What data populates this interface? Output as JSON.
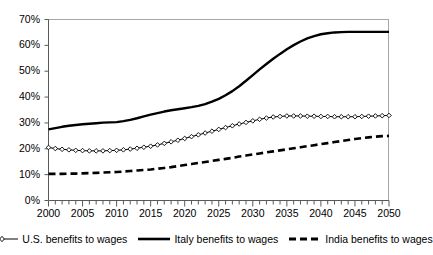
{
  "chart_data": {
    "type": "line",
    "title": "",
    "subtitle": "",
    "xlabel": "",
    "ylabel": "",
    "xlim": [
      2000,
      2050
    ],
    "ylim": [
      0,
      70
    ],
    "grid": false,
    "legend_position": "bottom",
    "y_tick_labels": [
      "70%",
      "60%",
      "50%",
      "40%",
      "30%",
      "20%",
      "10%",
      "0%"
    ],
    "y_ticks": [
      70,
      60,
      50,
      40,
      30,
      20,
      10,
      0
    ],
    "x_tick_labels": [
      "2000",
      "2005",
      "2010",
      "2015",
      "2020",
      "2025",
      "2030",
      "2035",
      "2040",
      "2045",
      "2050"
    ],
    "x_ticks": [
      2000,
      2005,
      2010,
      2015,
      2020,
      2025,
      2030,
      2035,
      2040,
      2045,
      2050
    ],
    "x_minor_tick_step": 1,
    "x": [
      2000,
      2001,
      2002,
      2003,
      2004,
      2005,
      2006,
      2007,
      2008,
      2009,
      2010,
      2011,
      2012,
      2013,
      2014,
      2015,
      2016,
      2017,
      2018,
      2019,
      2020,
      2021,
      2022,
      2023,
      2024,
      2025,
      2026,
      2027,
      2028,
      2029,
      2030,
      2031,
      2032,
      2033,
      2034,
      2035,
      2036,
      2037,
      2038,
      2039,
      2040,
      2041,
      2042,
      2043,
      2044,
      2045,
      2046,
      2047,
      2048,
      2049,
      2050
    ],
    "series": [
      {
        "name": "U.S. benefits to wages",
        "style": "solid-thin-markers",
        "marker": "diamond-open",
        "color": "#000000",
        "values": [
          20.5,
          20.1,
          19.8,
          19.6,
          19.4,
          19.3,
          19.2,
          19.2,
          19.2,
          19.3,
          19.4,
          19.6,
          19.9,
          20.2,
          20.6,
          21.0,
          21.5,
          22.1,
          22.7,
          23.3,
          24.0,
          24.7,
          25.4,
          26.1,
          26.8,
          27.5,
          28.2,
          28.9,
          29.6,
          30.2,
          30.8,
          31.4,
          31.9,
          32.3,
          32.5,
          32.7,
          32.7,
          32.7,
          32.6,
          32.6,
          32.5,
          32.5,
          32.4,
          32.4,
          32.4,
          32.4,
          32.5,
          32.6,
          32.7,
          32.8,
          32.9
        ]
      },
      {
        "name": "Italy benefits to wages",
        "style": "solid-thick",
        "marker": "none",
        "color": "#000000",
        "values": [
          27.5,
          28.0,
          28.5,
          28.9,
          29.2,
          29.5,
          29.7,
          29.9,
          30.1,
          30.2,
          30.3,
          30.7,
          31.2,
          31.8,
          32.5,
          33.2,
          33.8,
          34.4,
          34.9,
          35.3,
          35.7,
          36.1,
          36.6,
          37.3,
          38.2,
          39.3,
          40.7,
          42.3,
          44.2,
          46.3,
          48.5,
          50.7,
          52.8,
          54.8,
          56.7,
          58.5,
          60.1,
          61.5,
          62.7,
          63.6,
          64.3,
          64.7,
          65.0,
          65.1,
          65.2,
          65.2,
          65.2,
          65.2,
          65.2,
          65.2,
          65.2
        ]
      },
      {
        "name": "India benefits to wages",
        "style": "dashed-thick",
        "marker": "none",
        "color": "#000000",
        "values": [
          10.3,
          10.3,
          10.3,
          10.4,
          10.4,
          10.5,
          10.6,
          10.7,
          10.8,
          10.9,
          11.0,
          11.2,
          11.4,
          11.6,
          11.8,
          12.0,
          12.3,
          12.6,
          12.9,
          13.3,
          13.7,
          14.1,
          14.5,
          14.9,
          15.3,
          15.7,
          16.1,
          16.5,
          17.0,
          17.4,
          17.8,
          18.2,
          18.6,
          19.0,
          19.4,
          19.8,
          20.2,
          20.6,
          21.0,
          21.4,
          21.8,
          22.2,
          22.6,
          23.0,
          23.4,
          23.8,
          24.1,
          24.4,
          24.7,
          24.9,
          25.0
        ]
      }
    ],
    "legend": [
      {
        "label": "U.S. benefits to wages",
        "style": "solid-thin-markers"
      },
      {
        "label": "Italy benefits to wages",
        "style": "solid-thick"
      },
      {
        "label": "India benefits to wages",
        "style": "dashed-thick"
      }
    ]
  }
}
